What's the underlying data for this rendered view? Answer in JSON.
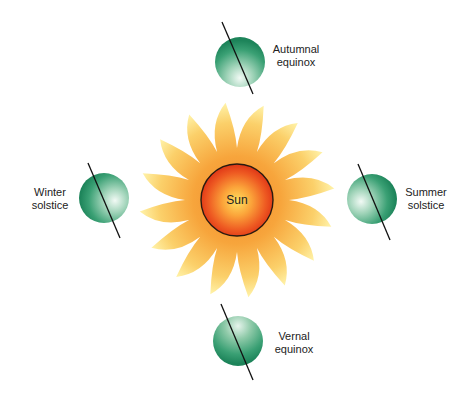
{
  "diagram": {
    "type": "earth-orbit-seasons",
    "sun": {
      "label": "Sun",
      "colors": {
        "core_outer": "#e8401c",
        "core_inner": "#ffd84a",
        "rays_outer": "#fff0a0",
        "rays_inner": "#f7a23a",
        "outline": "#2a1a10"
      }
    },
    "positions": [
      {
        "id": "autumnal",
        "line1": "Autumnal",
        "line2": "equinox"
      },
      {
        "id": "winter",
        "line1": "Winter",
        "line2": "solstice"
      },
      {
        "id": "summer",
        "line1": "Summer",
        "line2": "solstice"
      },
      {
        "id": "vernal",
        "line1": "Vernal",
        "line2": "equinox"
      }
    ],
    "earth_colors": {
      "dark": "#1f8a5c",
      "light": "#e9f5ef",
      "axis": "#111111"
    }
  }
}
